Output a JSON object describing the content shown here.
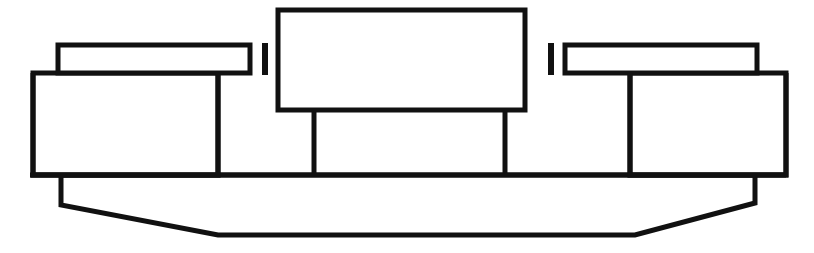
{
  "figure": {
    "kind": "line-art-schematic",
    "view": "front-elevation",
    "background_color": "#ffffff",
    "line_color": "#111111",
    "fill_color": "#ffffff",
    "line_width_px": 5,
    "canvas": {
      "width": 814,
      "height": 253
    }
  },
  "geometry": {
    "left_upper_bar": {
      "x": 58,
      "y": 45,
      "width": 192,
      "height": 28
    },
    "left_lower_block": {
      "x": 33,
      "y": 73,
      "width": 185,
      "height": 102
    },
    "left_tick": {
      "x": 262,
      "y": 43,
      "width": 6,
      "height": 32
    },
    "center_block": {
      "x": 278,
      "y": 10,
      "width": 247,
      "height": 100
    },
    "center_leg_left": {
      "x": 314,
      "y_top": 110,
      "y_bottom": 175
    },
    "center_leg_right": {
      "x": 505,
      "y_top": 110,
      "y_bottom": 175
    },
    "right_tick": {
      "x": 548,
      "y": 43,
      "width": 6,
      "height": 32
    },
    "right_upper_bar": {
      "x": 565,
      "y": 45,
      "width": 192,
      "height": 28
    },
    "right_lower_block": {
      "x": 630,
      "y": 73,
      "width": 156,
      "height": 102
    },
    "base_line": {
      "x1": 30,
      "y1": 175,
      "x2": 786,
      "y2": 175
    },
    "lower_body_points": "61,175 61,205 218,235 635,235 755,203 755,175"
  },
  "labels": {
    "left_upper_bar": "",
    "left_lower_block": "",
    "center_block": "",
    "right_upper_bar": "",
    "right_lower_block": "",
    "lower_body": ""
  }
}
